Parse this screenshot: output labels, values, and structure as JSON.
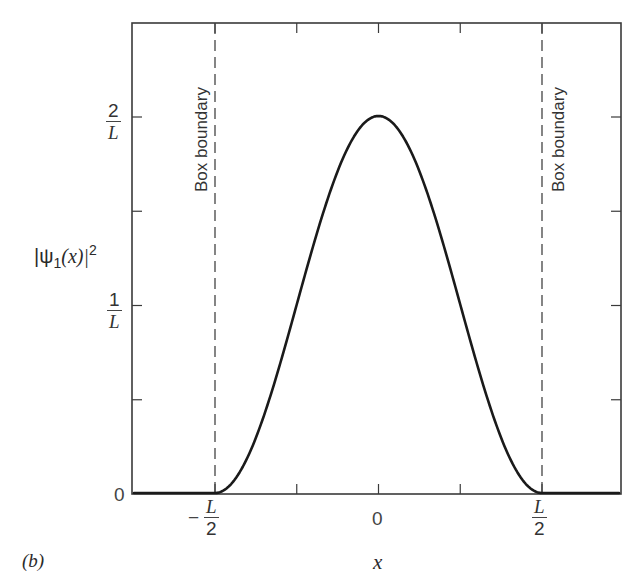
{
  "figure": {
    "panel_label": "(b)",
    "ylabel": "|ψ1(x)|²",
    "ylabel_parts": {
      "prefix": "|ψ",
      "sub": "1",
      "mid": "(x)|",
      "sup": "2"
    },
    "xlabel": "x",
    "annotations": {
      "left_boundary": "Box boundary",
      "right_boundary": "Box boundary"
    },
    "y_ticks": {
      "zero": "0",
      "one_over_L": {
        "num": "1",
        "den": "L"
      },
      "two_over_L": {
        "num": "2",
        "den": "L"
      }
    },
    "x_ticks": {
      "neg_half": {
        "sign": "−",
        "num": "L",
        "den": "2"
      },
      "zero": "0",
      "pos_half": {
        "num": "L",
        "den": "2"
      }
    },
    "colors": {
      "curve": "#1a1a1a",
      "axes": "#3a3a3a",
      "dashed": "#444444",
      "background": "#ffffff"
    }
  },
  "chart_data": {
    "type": "line",
    "title": "",
    "xlabel": "x",
    "ylabel": "|ψ1(x)|²",
    "x_units": "L",
    "y_units": "1/L",
    "xlim": [
      -0.75,
      0.75
    ],
    "ylim": [
      0,
      2.5
    ],
    "x_tick_values": [
      -0.5,
      0,
      0.5
    ],
    "x_tick_labels": [
      "−L/2",
      "0",
      "L/2"
    ],
    "x_minor_ticks": [
      -0.25,
      0.25
    ],
    "y_tick_values": [
      0,
      1,
      2
    ],
    "y_tick_labels": [
      "0",
      "1/L",
      "2/L"
    ],
    "y_minor_ticks": [
      0.5,
      1.5
    ],
    "grid": false,
    "legend": null,
    "series": [
      {
        "name": "|ψ1(x)|² = (2/L)cos²(πx/L) inside box, 0 outside",
        "x": [
          -0.75,
          -0.5,
          -0.45,
          -0.4,
          -0.35,
          -0.3,
          -0.25,
          -0.2,
          -0.15,
          -0.1,
          -0.05,
          0,
          0.05,
          0.1,
          0.15,
          0.2,
          0.25,
          0.3,
          0.35,
          0.4,
          0.45,
          0.5,
          0.75
        ],
        "y": [
          0,
          0,
          0.049,
          0.191,
          0.412,
          0.691,
          1.0,
          1.309,
          1.588,
          1.809,
          1.951,
          2.0,
          1.951,
          1.809,
          1.588,
          1.309,
          1.0,
          0.691,
          0.412,
          0.191,
          0.049,
          0,
          0
        ]
      }
    ],
    "annotations": [
      {
        "text": "Box boundary",
        "x": -0.5,
        "style": "dashed vertical line"
      },
      {
        "text": "Box boundary",
        "x": 0.5,
        "style": "dashed vertical line"
      }
    ],
    "panel_label": "(b)"
  }
}
